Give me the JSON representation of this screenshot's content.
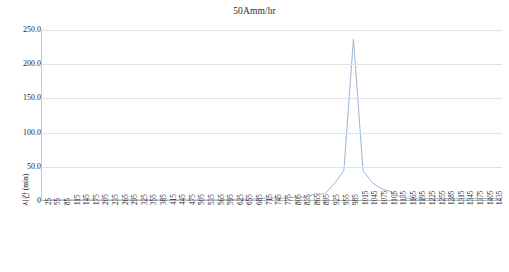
{
  "chart_data": {
    "type": "line",
    "title": "50Amm/hr",
    "xlabel": "시간 (min)",
    "ylabel": "",
    "ylim": [
      0,
      250
    ],
    "y_ticks": [
      "0",
      "50.0",
      "100.0",
      "150.0",
      "200.0",
      "250.0"
    ],
    "y_tick_values": [
      0,
      50,
      100,
      150,
      200,
      250
    ],
    "grid": true,
    "legend": "none",
    "line_color": "#9cb6d8",
    "x": [
      25,
      55,
      85,
      115,
      145,
      175,
      205,
      235,
      265,
      295,
      325,
      355,
      385,
      415,
      445,
      475,
      505,
      535,
      565,
      595,
      625,
      655,
      685,
      715,
      745,
      775,
      805,
      835,
      865,
      895,
      925,
      955,
      985,
      1015,
      1045,
      1075,
      1105,
      1135,
      1165,
      1195,
      1225,
      1255,
      1285,
      1315,
      1345,
      1375,
      1405,
      1435
    ],
    "values": [
      0,
      0,
      0,
      0,
      0,
      0,
      0,
      0,
      0,
      0,
      0,
      0,
      0,
      0,
      0,
      0,
      0,
      0,
      0,
      0.5,
      1.5,
      1.5,
      1.5,
      3,
      3,
      3,
      4,
      4,
      9,
      9,
      24,
      43,
      237,
      43,
      25,
      16,
      12,
      4,
      2,
      2,
      2,
      2,
      2,
      2,
      2,
      2,
      2,
      2
    ],
    "peak": {
      "x": 985,
      "y": 237
    }
  }
}
